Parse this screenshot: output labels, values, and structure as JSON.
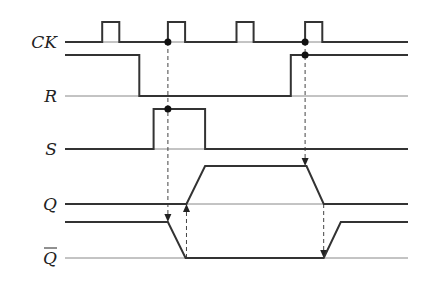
{
  "diagram": {
    "type": "timing-diagram",
    "time_range": [
      0,
      12
    ],
    "signals": [
      {
        "id": "ck",
        "label": "CK",
        "overline": false,
        "waveform": [
          [
            0,
            0
          ],
          [
            1.3,
            0
          ],
          [
            1.3,
            1
          ],
          [
            1.9,
            1
          ],
          [
            1.9,
            0
          ],
          [
            3.6,
            0
          ],
          [
            3.6,
            1
          ],
          [
            4.2,
            1
          ],
          [
            4.2,
            0
          ],
          [
            6.0,
            0
          ],
          [
            6.0,
            1
          ],
          [
            6.6,
            1
          ],
          [
            6.6,
            0
          ],
          [
            8.4,
            0
          ],
          [
            8.4,
            1
          ],
          [
            9.0,
            1
          ],
          [
            9.0,
            0
          ],
          [
            12,
            0
          ]
        ]
      },
      {
        "id": "r",
        "label": "R",
        "overline": false,
        "waveform": [
          [
            0,
            1
          ],
          [
            2.6,
            1
          ],
          [
            2.6,
            0
          ],
          [
            7.9,
            0
          ],
          [
            7.9,
            1
          ],
          [
            12,
            1
          ]
        ]
      },
      {
        "id": "s",
        "label": "S",
        "overline": false,
        "waveform": [
          [
            0,
            0
          ],
          [
            3.1,
            0
          ],
          [
            3.1,
            1
          ],
          [
            4.9,
            1
          ],
          [
            4.9,
            0
          ],
          [
            12,
            0
          ]
        ]
      },
      {
        "id": "q",
        "label": "Q",
        "overline": false,
        "waveform": [
          [
            0,
            0
          ],
          [
            4.25,
            0
          ],
          [
            4.9,
            1
          ],
          [
            8.45,
            1
          ],
          [
            9.05,
            0
          ],
          [
            12,
            0
          ]
        ]
      },
      {
        "id": "qbar",
        "label": "Q",
        "overline": true,
        "waveform": [
          [
            0,
            1
          ],
          [
            3.6,
            1
          ],
          [
            4.22,
            0
          ],
          [
            9.05,
            0
          ],
          [
            9.65,
            1
          ],
          [
            12,
            1
          ]
        ]
      }
    ],
    "sample_points": [
      {
        "signal": "ck",
        "t": 3.6
      },
      {
        "signal": "s",
        "t": 3.6
      },
      {
        "signal": "ck",
        "t": 8.4
      },
      {
        "signal": "r",
        "t": 8.4
      }
    ],
    "causal_arrows": [
      {
        "from_signal": "ck",
        "to_signal": "qbar",
        "t": 3.6,
        "direction": "down"
      },
      {
        "from_signal": "qbar",
        "to_signal": "q",
        "t": 4.25,
        "direction": "up",
        "from_level": 0,
        "to_level": 0
      },
      {
        "from_signal": "ck",
        "to_signal": "q",
        "t": 8.4,
        "direction": "down"
      },
      {
        "from_signal": "q",
        "to_signal": "qbar",
        "t": 9.05,
        "direction": "down",
        "from_level": 0,
        "to_level": 0
      }
    ]
  }
}
